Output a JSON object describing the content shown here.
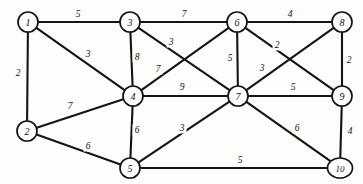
{
  "diagram": {
    "type": "weighted-undirected-graph",
    "background_color": "#fdfdfb",
    "node_fill_color": "#ffffff",
    "stroke_color": "#141414",
    "node_count": 10,
    "edge_count": 20
  },
  "nodes": [
    {
      "id": "1",
      "label": "1",
      "x": 28,
      "y": 22,
      "rx": 10,
      "ry": 10
    },
    {
      "id": "2",
      "label": "2",
      "x": 27,
      "y": 131,
      "rx": 10,
      "ry": 10
    },
    {
      "id": "3",
      "label": "3",
      "x": 130,
      "y": 22,
      "rx": 10,
      "ry": 10
    },
    {
      "id": "4",
      "label": "4",
      "x": 133,
      "y": 96,
      "rx": 10,
      "ry": 10
    },
    {
      "id": "5",
      "label": "5",
      "x": 130,
      "y": 168,
      "rx": 10,
      "ry": 10
    },
    {
      "id": "6",
      "label": "6",
      "x": 237,
      "y": 22,
      "rx": 10,
      "ry": 10
    },
    {
      "id": "7",
      "label": "7",
      "x": 238,
      "y": 96,
      "rx": 10,
      "ry": 10
    },
    {
      "id": "8",
      "label": "8",
      "x": 342,
      "y": 22,
      "rx": 10,
      "ry": 10
    },
    {
      "id": "9",
      "label": "9",
      "x": 342,
      "y": 96,
      "rx": 10,
      "ry": 10
    },
    {
      "id": "10",
      "label": "10",
      "x": 340,
      "y": 168,
      "rx": 12.5,
      "ry": 10
    }
  ],
  "edges": [
    {
      "id": "e-1-3",
      "from": "1",
      "to": "3",
      "weight": "5",
      "lx": 78,
      "ly": 14
    },
    {
      "id": "e-1-2",
      "from": "1",
      "to": "2",
      "weight": "2",
      "lx": 18,
      "ly": 73
    },
    {
      "id": "e-1-4",
      "from": "1",
      "to": "4",
      "weight": "3",
      "lx": 88,
      "ly": 54
    },
    {
      "id": "e-3-6",
      "from": "3",
      "to": "6",
      "weight": "7",
      "lx": 184,
      "ly": 14
    },
    {
      "id": "e-3-4",
      "from": "3",
      "to": "4",
      "weight": "8",
      "lx": 137,
      "ly": 57
    },
    {
      "id": "e-3-7",
      "from": "3",
      "to": "7",
      "weight": "3",
      "lx": 171,
      "ly": 42
    },
    {
      "id": "e-4-6",
      "from": "4",
      "to": "6",
      "weight": "7",
      "lx": 158,
      "ly": 69
    },
    {
      "id": "e-4-7",
      "from": "4",
      "to": "7",
      "weight": "9",
      "lx": 182,
      "ly": 87
    },
    {
      "id": "e-2-4",
      "from": "2",
      "to": "4",
      "weight": "7",
      "lx": 70,
      "ly": 106
    },
    {
      "id": "e-2-5",
      "from": "2",
      "to": "5",
      "weight": "6",
      "lx": 88,
      "ly": 146
    },
    {
      "id": "e-4-5",
      "from": "4",
      "to": "5",
      "weight": "6",
      "lx": 137,
      "ly": 130
    },
    {
      "id": "e-5-7",
      "from": "5",
      "to": "7",
      "weight": "3",
      "lx": 182,
      "ly": 128
    },
    {
      "id": "e-5-10",
      "from": "5",
      "to": "10",
      "weight": "5",
      "lx": 240,
      "ly": 160
    },
    {
      "id": "e-6-8",
      "from": "6",
      "to": "8",
      "weight": "4",
      "lx": 290,
      "ly": 14
    },
    {
      "id": "e-6-7",
      "from": "6",
      "to": "7",
      "weight": "5",
      "lx": 230,
      "ly": 58
    },
    {
      "id": "e-6-9",
      "from": "6",
      "to": "9",
      "weight": "2",
      "lx": 277,
      "ly": 45
    },
    {
      "id": "e-7-8",
      "from": "7",
      "to": "8",
      "weight": "3",
      "lx": 262,
      "ly": 68
    },
    {
      "id": "e-7-9",
      "from": "7",
      "to": "9",
      "weight": "5",
      "lx": 293,
      "ly": 87
    },
    {
      "id": "e-8-9",
      "from": "8",
      "to": "9",
      "weight": "2",
      "lx": 349,
      "ly": 60
    },
    {
      "id": "e-7-10",
      "from": "7",
      "to": "10",
      "weight": "6",
      "lx": 297,
      "ly": 128
    },
    {
      "id": "e-9-10",
      "from": "9",
      "to": "10",
      "weight": "4",
      "lx": 350,
      "ly": 131
    }
  ]
}
